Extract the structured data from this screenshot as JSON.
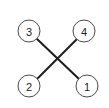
{
  "diagram": {
    "title": "",
    "nodes": [
      {
        "id": "n3",
        "label": "3",
        "position": "top-left"
      },
      {
        "id": "n4",
        "label": "4",
        "position": "top-right"
      },
      {
        "id": "n2",
        "label": "2",
        "position": "bottom-left"
      },
      {
        "id": "n1",
        "label": "1",
        "position": "bottom-right"
      }
    ],
    "edges": [
      {
        "from": "n3",
        "to": "n1"
      },
      {
        "from": "n2",
        "to": "n4"
      }
    ],
    "colors": {
      "edge": "#1c1c1c",
      "node_stroke": "#4a4a4a",
      "node_fill": "#ffffff",
      "label": "#222222"
    }
  }
}
